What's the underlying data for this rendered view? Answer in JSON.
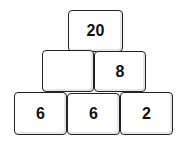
{
  "diagram": {
    "type": "number-pyramid",
    "rows": [
      {
        "row": "top",
        "blocks": [
          {
            "value": "20"
          }
        ]
      },
      {
        "row": "middle",
        "blocks": [
          {
            "value": ""
          },
          {
            "value": "8"
          }
        ]
      },
      {
        "row": "bottom",
        "blocks": [
          {
            "value": "6"
          },
          {
            "value": "6"
          },
          {
            "value": "2"
          }
        ]
      }
    ]
  }
}
